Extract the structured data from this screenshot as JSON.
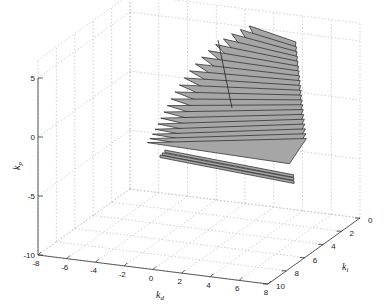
{
  "chart_data": {
    "type": "surface3d",
    "title": "",
    "xlabel": "k_d",
    "ylabel": "k_i",
    "zlabel": "k_p",
    "x_ticks": [
      -8,
      -6,
      -4,
      -2,
      0,
      2,
      4,
      6,
      8
    ],
    "y_ticks": [
      0,
      2,
      4,
      6,
      8,
      10
    ],
    "z_ticks": [
      5,
      0,
      -5,
      -10
    ],
    "xlim": [
      -8,
      8
    ],
    "ylim": [
      0,
      10
    ],
    "zlim": [
      -10,
      5
    ],
    "grid": true,
    "face_color": "#a6a6a6",
    "edge_color": "#222222",
    "slice_count": 24
  },
  "labels": {
    "x": "k",
    "x_sub": "d",
    "y": "k",
    "y_sub": "i",
    "z": "k",
    "z_sub": "p"
  }
}
